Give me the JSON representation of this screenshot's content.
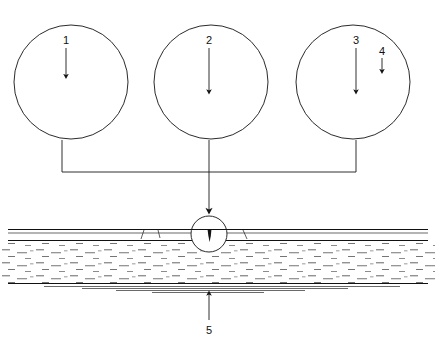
{
  "figure": {
    "background_color": "#ffffff",
    "line_color": "#111111",
    "width": 435,
    "height": 345
  },
  "callouts": [
    {
      "id": "1",
      "label": "1",
      "meaning": "crack-in-surface-layer",
      "x": 66,
      "y": 40
    },
    {
      "id": "2",
      "label": "2",
      "meaning": "routed-v-groove",
      "x": 211,
      "y": 40
    },
    {
      "id": "3",
      "label": "3",
      "meaning": "sealant-filled-groove",
      "x": 356,
      "y": 40
    },
    {
      "id": "4",
      "label": "4",
      "meaning": "surface-overband-strip",
      "x": 382,
      "y": 52
    },
    {
      "id": "5",
      "label": "5",
      "meaning": "road-base-layer",
      "x": 211,
      "y": 332
    }
  ],
  "detail_circles": [
    {
      "name": "detail-crack",
      "callout": "1",
      "cx": 71,
      "cy": 82,
      "r": 57,
      "description": "Narrow hairline crack penetrating the bituminous surface layer down to the base course"
    },
    {
      "name": "detail-routed-groove",
      "callout": "2",
      "cx": 211,
      "cy": 82,
      "r": 57,
      "description": "Crack widened into a V-shaped routed groove ready for sealing"
    },
    {
      "name": "detail-sealed-groove",
      "callout": "3",
      "cx": 353,
      "cy": 82,
      "r": 57,
      "description": "V-groove filled with sealant and covered by a surface overband strip"
    }
  ],
  "road_section": {
    "name": "road-cross-section",
    "surface_y": 229,
    "binder_y": 240,
    "base_y": 283,
    "layers": [
      {
        "name": "surface-course",
        "top": 229,
        "bottom": 240
      },
      {
        "name": "binder-course",
        "top": 240,
        "bottom": 283
      },
      {
        "name": "base-course",
        "top": 283,
        "bottom": 292
      }
    ],
    "crack_marker": {
      "name": "crack-location-circle",
      "cx": 209,
      "cy": 234,
      "r": 18
    }
  },
  "connectors": {
    "bracket_y": 172,
    "left_x": 62,
    "right_x": 356,
    "center_x": 209,
    "arrow_target_y": 214
  }
}
